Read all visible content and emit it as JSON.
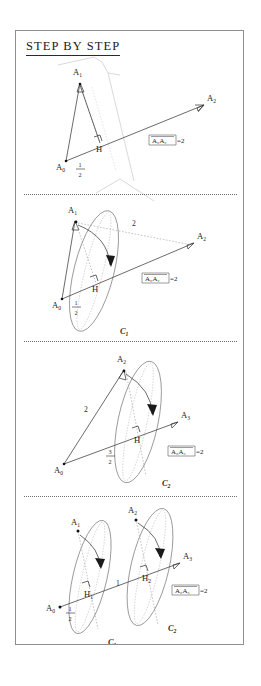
{
  "figure": {
    "title": "STEP BY STEP",
    "border_color": "#8e8e8e",
    "ink_color": "#1a1a1a"
  },
  "panels": [
    {
      "id": "panel-1",
      "points": [
        {
          "name": "A0",
          "label": "A",
          "sub": "0"
        },
        {
          "name": "A1",
          "label": "A",
          "sub": "1"
        },
        {
          "name": "A2",
          "label": "A",
          "sub": "2"
        },
        {
          "name": "H",
          "label": "H",
          "sub": ""
        }
      ],
      "measure_label": "1",
      "measure_denom": "2",
      "equation": {
        "bar": "A₀A₂",
        "value": "=2"
      },
      "equation_lhs": "A₀A₂",
      "equation_rhs": "=2"
    },
    {
      "id": "panel-2",
      "points": [
        {
          "name": "A0",
          "label": "A",
          "sub": "0"
        },
        {
          "name": "A1",
          "label": "A",
          "sub": "1"
        },
        {
          "name": "A2",
          "label": "A",
          "sub": "2"
        },
        {
          "name": "H",
          "label": "H",
          "sub": ""
        }
      ],
      "chord_label": "2",
      "measure_label": "1",
      "measure_denom": "2",
      "equation_lhs": "A₀A₂",
      "equation_rhs": "=2",
      "conic": {
        "label": "C",
        "sub": "1"
      }
    },
    {
      "id": "panel-3",
      "points": [
        {
          "name": "A0",
          "label": "A",
          "sub": "0"
        },
        {
          "name": "A2",
          "label": "A",
          "sub": "2"
        },
        {
          "name": "A3",
          "label": "A",
          "sub": "3"
        },
        {
          "name": "H",
          "label": "H",
          "sub": ""
        }
      ],
      "chord_label": "2",
      "measure_label": "3",
      "measure_denom": "2",
      "equation_lhs": "A₀A₃",
      "equation_rhs": "=2",
      "conic": {
        "label": "C",
        "sub": "2"
      }
    },
    {
      "id": "panel-4",
      "points": [
        {
          "name": "A0",
          "label": "A",
          "sub": "0"
        },
        {
          "name": "A1",
          "label": "A",
          "sub": "1"
        },
        {
          "name": "A2",
          "label": "A",
          "sub": "2"
        },
        {
          "name": "A3",
          "label": "A",
          "sub": "3"
        },
        {
          "name": "H1",
          "label": "H",
          "sub": "1"
        },
        {
          "name": "H2",
          "label": "H",
          "sub": "2"
        }
      ],
      "measure_label": "1",
      "measure_denom": "2",
      "mid_label": "1",
      "equation_lhs": "A₀A₃",
      "equation_rhs": "=2",
      "conic_1": {
        "label": "C",
        "sub": "1"
      },
      "conic_2": {
        "label": "C",
        "sub": "2"
      }
    }
  ]
}
